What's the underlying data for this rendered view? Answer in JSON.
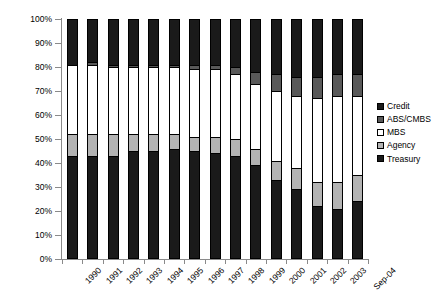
{
  "chart_data": {
    "type": "bar",
    "stacked": true,
    "title": "",
    "subtitle": "",
    "xlabel": "",
    "ylabel": "",
    "ylim": [
      0,
      100
    ],
    "ytick_labels": [
      "100%",
      "90%",
      "80%",
      "70%",
      "60%",
      "50%",
      "40%",
      "30%",
      "20%",
      "10%",
      "0%"
    ],
    "ytick_values": [
      100,
      90,
      80,
      70,
      60,
      50,
      40,
      30,
      20,
      10,
      0
    ],
    "grid": false,
    "legend_position": "right",
    "categories": [
      "1990",
      "1991",
      "1992",
      "1993",
      "1994",
      "1995",
      "1996",
      "1997",
      "1998",
      "1999",
      "2000",
      "2001",
      "2002",
      "2003",
      "Sep-04"
    ],
    "stack_order_bottom_to_top": [
      "Treasury",
      "Agency",
      "MBS",
      "ABS/CMBS",
      "Credit"
    ],
    "series": [
      {
        "name": "Treasury",
        "color": "#1a1a1a",
        "values": [
          43,
          43,
          43,
          45,
          45,
          46,
          45,
          44,
          43,
          39,
          33,
          29,
          22,
          21,
          24
        ]
      },
      {
        "name": "Agency",
        "color": "#b3b3b3",
        "values": [
          9,
          9,
          9,
          7,
          7,
          6,
          6,
          7,
          7,
          7,
          8,
          9,
          10,
          11,
          11
        ]
      },
      {
        "name": "MBS",
        "color": "#ffffff",
        "values": [
          29,
          29,
          28,
          28,
          28,
          28,
          28,
          28,
          27,
          27,
          29,
          30,
          35,
          36,
          33
        ]
      },
      {
        "name": "ABS/CMBS",
        "color": "#595959",
        "values": [
          0,
          1,
          1,
          1,
          1,
          1,
          2,
          2,
          3,
          5,
          7,
          8,
          9,
          9,
          9
        ]
      },
      {
        "name": "Credit",
        "color": "#1a1a1a",
        "values": [
          19,
          18,
          19,
          19,
          19,
          19,
          19,
          19,
          20,
          22,
          23,
          24,
          24,
          23,
          23
        ]
      }
    ],
    "legend_entries": [
      {
        "label": "Credit",
        "color": "#1a1a1a"
      },
      {
        "label": "ABS/CMBS",
        "color": "#595959"
      },
      {
        "label": "MBS",
        "color": "#ffffff"
      },
      {
        "label": "Agency",
        "color": "#b3b3b3"
      },
      {
        "label": "Treasury",
        "color": "#1a1a1a"
      }
    ]
  }
}
